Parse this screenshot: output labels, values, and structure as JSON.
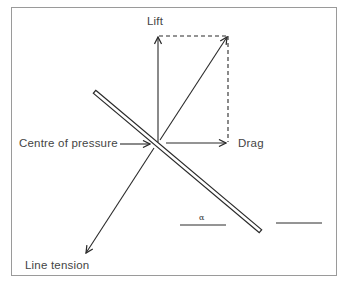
{
  "diagram": {
    "type": "kite force diagram",
    "labels": {
      "lift": "Lift",
      "drag": "Drag",
      "centre_of_pressure": "Centre of pressure",
      "line_tension": "Line tension",
      "angle": "α"
    },
    "colors": {
      "line": "#2a2a2a",
      "frame": "#9a9a9a",
      "text": "#444444"
    }
  }
}
